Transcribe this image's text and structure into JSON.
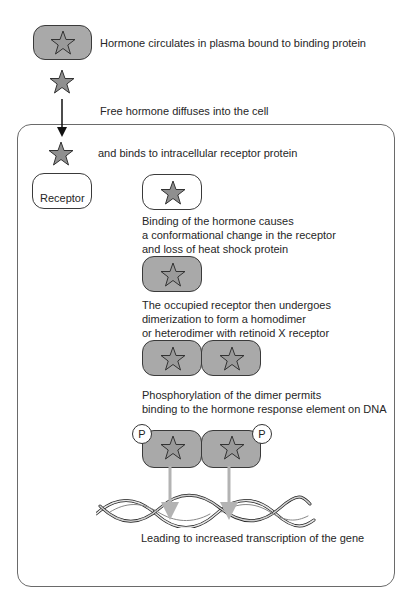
{
  "diagram": {
    "colors": {
      "protein_fill": "#a9a9a9",
      "star_fill": "#8f8f8f",
      "outline": "#3a3a3a",
      "dna_arrow": "#b3b3b3",
      "cell_border": "#6a6a6a"
    },
    "steps": [
      {
        "id": "plasma",
        "label": "Hormone circulates in plasma bound to binding protein"
      },
      {
        "id": "diffuse",
        "label": "Free hormone diffuses into the cell"
      },
      {
        "id": "bind",
        "label": "and binds to intracellular receptor protein"
      },
      {
        "id": "conformation",
        "lines": [
          "Binding of the hormone causes",
          "a conformational change in the receptor",
          "and loss of heat shock protein"
        ]
      },
      {
        "id": "dimerization",
        "lines": [
          "The occupied receptor then undergoes",
          "dimerization to form a homodimer",
          "or heterodimer with retinoid X receptor"
        ]
      },
      {
        "id": "phosphorylation",
        "lines": [
          "Phosphorylation of the dimer permits",
          "binding to the hormone response element on DNA"
        ]
      },
      {
        "id": "transcription",
        "label": "Leading to increased transcription of the gene"
      }
    ],
    "receptor_label": "Receptor",
    "phosphate_label": "P",
    "icons": {
      "hormone": "star-icon",
      "dna": "dna-helix-icon",
      "arrow": "arrow-down-icon"
    }
  }
}
